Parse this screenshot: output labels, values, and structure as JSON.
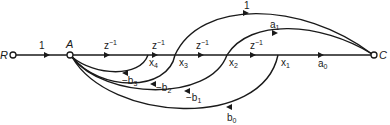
{
  "diagram": {
    "type": "signal-flow-graph",
    "nodes": {
      "input": "R",
      "junction": "A",
      "output": "C"
    },
    "state_nodes": [
      {
        "id": "x4",
        "base": "x",
        "sub": "4"
      },
      {
        "id": "x3",
        "base": "x",
        "sub": "3"
      },
      {
        "id": "x2",
        "base": "x",
        "sub": "2"
      },
      {
        "id": "x1",
        "base": "x",
        "sub": "1"
      }
    ],
    "forward_path": {
      "input_gain": "1",
      "delays": [
        {
          "base": "z",
          "sup": "−1"
        },
        {
          "base": "z",
          "sup": "−1"
        },
        {
          "base": "z",
          "sup": "−1"
        },
        {
          "base": "z",
          "sup": "−1"
        }
      ],
      "output_gain": {
        "base": "a",
        "sub": "0"
      }
    },
    "feedforward_arcs": [
      {
        "from": "x3",
        "to": "C",
        "label": {
          "base": "1",
          "sub": ""
        }
      },
      {
        "from": "x2",
        "to": "C",
        "label": {
          "base": "a",
          "sub": "1"
        }
      }
    ],
    "feedback_arcs": [
      {
        "from": "x4",
        "to": "A",
        "label": {
          "base": "−b",
          "sub": "3"
        }
      },
      {
        "from": "x3",
        "to": "A",
        "label": {
          "base": "−b",
          "sub": "2"
        }
      },
      {
        "from": "x2",
        "to": "A",
        "label": {
          "base": "−b",
          "sub": "1"
        }
      },
      {
        "from": "x1",
        "to": "A",
        "label": {
          "base": "b",
          "sub": "0"
        }
      }
    ]
  }
}
